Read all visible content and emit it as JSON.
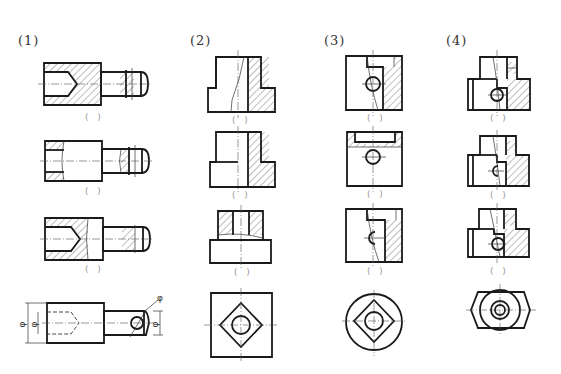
{
  "columns": [
    {
      "label": "(1)",
      "answer_slots": [
        "( )",
        "( )",
        "( )"
      ]
    },
    {
      "label": "(2)",
      "answer_slots": [
        "( )",
        "( )",
        "( )"
      ]
    },
    {
      "label": "(3)",
      "answer_slots": [
        "( )",
        "( )",
        "( )"
      ]
    },
    {
      "label": "(4)",
      "answer_slots": [
        "( )",
        "( )",
        "( )"
      ]
    }
  ],
  "dimensions": {
    "col1_left_outer": "φ",
    "col1_left_inner": "φ",
    "col1_right_pin": "φ",
    "col1_right_hole": "φ"
  },
  "colors": {
    "outline": "#1a1a1a",
    "hatch": "#444444",
    "label_text": "#333333",
    "answer_slot": "#999999",
    "background": "#ffffff"
  }
}
